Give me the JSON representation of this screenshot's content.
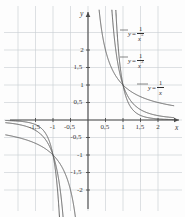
{
  "figure": {
    "background_color": "#fdfdfd",
    "grid_color": "#c8cdd2",
    "axis_color": "#4a4a4a",
    "curve_color": "#555555",
    "label_color": "#3a3a3a"
  },
  "axes": {
    "x_name": "x",
    "y_name": "y",
    "x_ticks": [
      {
        "value": -1.5,
        "label": "-1,5"
      },
      {
        "value": -1.0,
        "label": "-1"
      },
      {
        "value": -0.5,
        "label": "-0,5"
      },
      {
        "value": 0.5,
        "label": "0,5"
      },
      {
        "value": 1.0,
        "label": "1"
      },
      {
        "value": 1.5,
        "label": "1,5"
      },
      {
        "value": 2.0,
        "label": "2"
      }
    ],
    "y_ticks": [
      {
        "value": 2.0,
        "label": "2"
      },
      {
        "value": 1.5,
        "label": "1,5"
      },
      {
        "value": 1.0,
        "label": "1"
      },
      {
        "value": 0.5,
        "label": "0,5"
      },
      {
        "value": -0.5,
        "label": "-0,5"
      },
      {
        "value": -1.0,
        "label": "-1"
      },
      {
        "value": -1.5,
        "label": "-1,5"
      },
      {
        "value": -2.0,
        "label": "-2"
      }
    ]
  },
  "callouts": [
    {
      "lhs": "y",
      "eq": "=",
      "num": "1",
      "den": "x",
      "exp": "5"
    },
    {
      "lhs": "y",
      "eq": "=",
      "num": "1",
      "den": "x",
      "exp": "3"
    },
    {
      "lhs": "y",
      "eq": "=",
      "num": "1",
      "den": "x",
      "exp": ""
    }
  ],
  "chart_data": {
    "type": "line",
    "title": "",
    "xlabel": "x",
    "ylabel": "y",
    "xlim": [
      -2.35,
      2.45
    ],
    "ylim": [
      -2.45,
      2.55
    ],
    "grid": true,
    "grid_step": 0.5,
    "legend_position": "inline-callouts",
    "annotations": [
      "y = 1/x^5",
      "y = 1/x^3",
      "y = 1/x"
    ],
    "series": [
      {
        "name": "y = 1/x^5",
        "expression": "1/x^5",
        "exponent": 5,
        "points_branch_positive": [
          [
            0.75,
            4.21
          ],
          [
            0.8,
            3.05
          ],
          [
            0.85,
            2.25
          ],
          [
            0.9,
            1.69
          ],
          [
            0.95,
            1.29
          ],
          [
            1.0,
            1.0
          ],
          [
            1.1,
            0.62
          ],
          [
            1.2,
            0.4
          ],
          [
            1.4,
            0.19
          ],
          [
            1.6,
            0.1
          ],
          [
            1.8,
            0.05
          ],
          [
            2.0,
            0.03
          ],
          [
            2.4,
            0.013
          ]
        ],
        "points_branch_negative": [
          [
            -2.4,
            -0.013
          ],
          [
            -2.0,
            -0.03
          ],
          [
            -1.8,
            -0.05
          ],
          [
            -1.6,
            -0.1
          ],
          [
            -1.4,
            -0.19
          ],
          [
            -1.2,
            -0.4
          ],
          [
            -1.1,
            -0.62
          ],
          [
            -1.0,
            -1.0
          ],
          [
            -0.95,
            -1.29
          ],
          [
            -0.9,
            -1.69
          ],
          [
            -0.85,
            -2.25
          ],
          [
            -0.8,
            -3.05
          ]
        ]
      },
      {
        "name": "y = 1/x^3",
        "expression": "1/x^3",
        "exponent": 3,
        "points_branch_positive": [
          [
            0.7,
            2.92
          ],
          [
            0.75,
            2.37
          ],
          [
            0.8,
            1.95
          ],
          [
            0.9,
            1.37
          ],
          [
            1.0,
            1.0
          ],
          [
            1.1,
            0.75
          ],
          [
            1.2,
            0.58
          ],
          [
            1.4,
            0.36
          ],
          [
            1.6,
            0.24
          ],
          [
            1.8,
            0.17
          ],
          [
            2.0,
            0.125
          ],
          [
            2.4,
            0.072
          ]
        ],
        "points_branch_negative": [
          [
            -2.4,
            -0.072
          ],
          [
            -2.0,
            -0.125
          ],
          [
            -1.8,
            -0.17
          ],
          [
            -1.6,
            -0.24
          ],
          [
            -1.4,
            -0.36
          ],
          [
            -1.2,
            -0.58
          ],
          [
            -1.1,
            -0.75
          ],
          [
            -1.0,
            -1.0
          ],
          [
            -0.9,
            -1.37
          ],
          [
            -0.8,
            -1.95
          ],
          [
            -0.75,
            -2.37
          ],
          [
            -0.7,
            -2.92
          ]
        ]
      },
      {
        "name": "y = 1/x",
        "expression": "1/x",
        "exponent": 1,
        "points_branch_positive": [
          [
            0.42,
            2.38
          ],
          [
            0.5,
            2.0
          ],
          [
            0.6,
            1.67
          ],
          [
            0.7,
            1.43
          ],
          [
            0.8,
            1.25
          ],
          [
            0.9,
            1.11
          ],
          [
            1.0,
            1.0
          ],
          [
            1.2,
            0.83
          ],
          [
            1.4,
            0.71
          ],
          [
            1.6,
            0.625
          ],
          [
            1.8,
            0.56
          ],
          [
            2.0,
            0.5
          ],
          [
            2.4,
            0.42
          ]
        ],
        "points_branch_negative": [
          [
            -2.4,
            -0.42
          ],
          [
            -2.0,
            -0.5
          ],
          [
            -1.8,
            -0.56
          ],
          [
            -1.6,
            -0.625
          ],
          [
            -1.4,
            -0.71
          ],
          [
            -1.2,
            -0.83
          ],
          [
            -1.0,
            -1.0
          ],
          [
            -0.9,
            -1.11
          ],
          [
            -0.8,
            -1.25
          ],
          [
            -0.7,
            -1.43
          ],
          [
            -0.6,
            -1.67
          ],
          [
            -0.5,
            -2.0
          ],
          [
            -0.42,
            -2.38
          ]
        ]
      }
    ]
  }
}
